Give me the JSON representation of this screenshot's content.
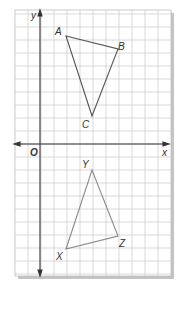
{
  "diagram": {
    "type": "coordinate-grid",
    "grid": {
      "cell_px": 13,
      "x_min": -2,
      "x_max": 10,
      "y_min": -10,
      "y_max": 10,
      "origin_px": [
        40,
        144
      ]
    },
    "axes": {
      "x_label": "x",
      "y_label": "y",
      "origin_label": "O"
    },
    "colors": {
      "grid": "#c8c8c8",
      "axis": "#333333",
      "triangle_abc": "#555555",
      "triangle_xyz": "#888888",
      "shadow": "#bbbbbb"
    },
    "triangles": [
      {
        "name": "ABC",
        "vertices": [
          {
            "label": "A",
            "x": 2,
            "y": 8
          },
          {
            "label": "B",
            "x": 6,
            "y": 7
          },
          {
            "label": "C",
            "x": 4,
            "y": 2
          }
        ]
      },
      {
        "name": "XYZ",
        "vertices": [
          {
            "label": "X",
            "x": 2,
            "y": -8
          },
          {
            "label": "Y",
            "x": 4,
            "y": -2
          },
          {
            "label": "Z",
            "x": 6,
            "y": -7
          }
        ]
      }
    ]
  },
  "labels": {
    "A": "A",
    "B": "B",
    "C": "C",
    "X": "X",
    "Y": "Y",
    "Z": "Z",
    "x_axis": "x",
    "y_axis": "y",
    "origin": "O"
  }
}
